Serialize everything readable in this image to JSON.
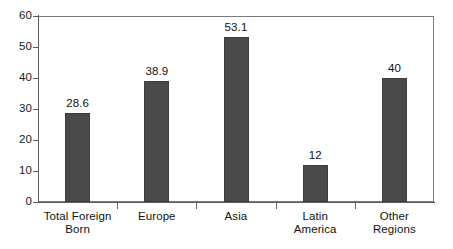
{
  "chart_data": {
    "type": "bar",
    "title": "",
    "subtitle": "",
    "xlabel": "",
    "ylabel": "",
    "categories": [
      "Total Foreign\nBorn",
      "Europe",
      "Asia",
      "Latin\nAmerica",
      "Other\nRegions"
    ],
    "values": [
      28.6,
      38.9,
      53.1,
      12,
      40
    ],
    "value_labels": [
      "28.6",
      "38.9",
      "53.1",
      "12",
      "40"
    ],
    "ylim": [
      0,
      60
    ],
    "yticks": [
      0,
      10,
      20,
      30,
      40,
      50,
      60
    ],
    "ytick_labels": [
      "0",
      "10",
      "20",
      "30",
      "40",
      "50",
      "60"
    ],
    "grid": false,
    "legend": null,
    "bar_color": "#4a4a4a",
    "frame_color": "#7d7d7d",
    "background": "#ffffff"
  }
}
